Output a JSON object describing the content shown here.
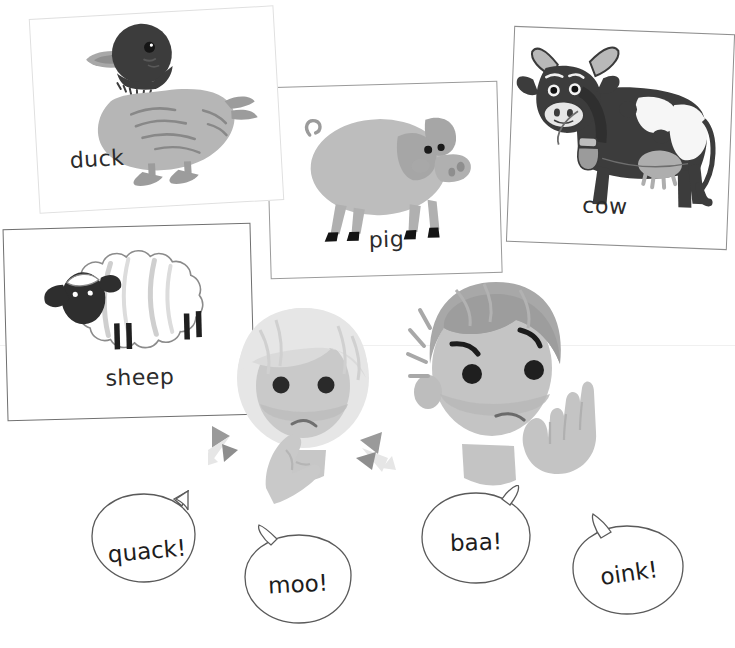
{
  "page": {
    "background_color": "#ffffff",
    "width": 735,
    "height": 648,
    "cutoff_top_text": "",
    "ink_color": "#2b2b2b"
  },
  "cards": [
    {
      "id": "duck",
      "label": "duck",
      "animal": "duck-illustration",
      "border_color": "#e0e0e0",
      "body_color": "#b4b4b4",
      "head_color": "#3a3a3a",
      "bill_color": "#a0a0a0"
    },
    {
      "id": "pig",
      "label": "pig",
      "animal": "pig-illustration",
      "border_color": "#9a9a9a",
      "body_color": "#b9b9b9",
      "shade_color": "#9e9e9e",
      "hoof_color": "#111111"
    },
    {
      "id": "cow",
      "label": "cow",
      "animal": "cow-illustration",
      "border_color": "#8f8f8f",
      "body_color": "#3a3a3a",
      "patch_color": "#f4f4f4",
      "udder_color": "#b0b0b0",
      "bell_color": "#9a9a9a"
    },
    {
      "id": "sheep",
      "label": "sheep",
      "animal": "sheep-illustration",
      "border_color": "#6f6f6f",
      "fleece_color": "#fdfdfd",
      "fleece_outline": "#8a8a8a",
      "face_color": "#2e2e2e"
    }
  ],
  "kids": [
    {
      "id": "girl",
      "name": "girl-character",
      "hair_color": "#e3e3e3",
      "skin_color": "#c9c9c9",
      "bow_color": "#9c9c9c",
      "eye_color": "#2a2a2a",
      "expression": "thinking"
    },
    {
      "id": "boy",
      "name": "boy-character",
      "hair_color": "#a8a8a8",
      "skin_color": "#c4c4c4",
      "eye_color": "#1f1f1f",
      "expression": "listening"
    }
  ],
  "bubbles": [
    {
      "id": "quack",
      "text": "quack!"
    },
    {
      "id": "moo",
      "text": "moo!"
    },
    {
      "id": "baa",
      "text": "baa!"
    },
    {
      "id": "oink",
      "text": "oink!"
    }
  ]
}
